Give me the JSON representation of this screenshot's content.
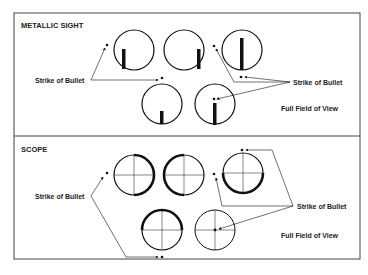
{
  "panels": [
    {
      "title": "METALLIC SIGHT",
      "left_label": "Strike of Bullet",
      "right_label": "Strike of Bullet",
      "field_label": "Full Field of View"
    },
    {
      "title": "SCOPE",
      "left_label": "Strike of Bullet",
      "right_label": "Strike of Bullet",
      "field_label": "Full Field of View"
    }
  ],
  "colors": {
    "ink": "#111111",
    "border": "#444444",
    "background": "#ffffff"
  }
}
